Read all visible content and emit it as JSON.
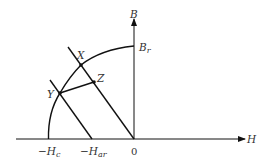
{
  "diagram": {
    "type": "BH demagnetization curve",
    "axes": {
      "x_label": "H",
      "y_label": "B"
    },
    "labels": {
      "br": "B",
      "br_sub": "r",
      "hc_prefix": "−H",
      "hc_sub": "c",
      "har_prefix": "−H",
      "har_sub": "ar",
      "origin": "0"
    },
    "points": {
      "x": "X",
      "y": "Y",
      "z": "Z"
    },
    "colors": {
      "line": "#111111",
      "text": "#333333"
    }
  }
}
